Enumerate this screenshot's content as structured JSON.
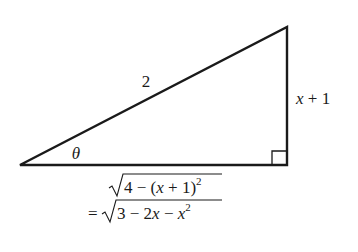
{
  "diagram": {
    "type": "right-triangle",
    "hypotenuse_label": "2",
    "opposite_label": "x + 1",
    "angle_label": "θ",
    "adjacent_label_line1": "4 − (x + 1)",
    "adjacent_label_line1_exponent": "2",
    "adjacent_label_line2_prefix": "=",
    "adjacent_label_line2": "3 − 2x − x",
    "adjacent_label_line2_exponent": "2",
    "vertices": {
      "angle_vertex": [
        20,
        165
      ],
      "top_vertex": [
        287,
        27
      ],
      "right_angle_vertex": [
        287,
        165
      ]
    },
    "line_color": "#1a1a1a"
  }
}
